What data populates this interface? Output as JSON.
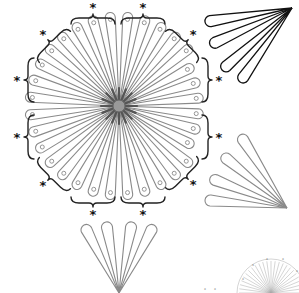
{
  "diagram": {
    "title": "",
    "center": {
      "x": 119,
      "y": 106,
      "disc_radius": 6
    },
    "petal_count": 32,
    "petal_length": 94,
    "petal_width": 7,
    "asterisk": "*",
    "brackets": [
      {
        "id": "top-left",
        "x": 93,
        "y": 10,
        "angle": 0
      },
      {
        "id": "top-right",
        "x": 143,
        "y": 10,
        "angle": 0
      },
      {
        "id": "upper-left",
        "x": 45,
        "y": 37,
        "angle": -45
      },
      {
        "id": "left-upper",
        "x": 20,
        "y": 80,
        "angle": -90
      },
      {
        "id": "left-lower",
        "x": 20,
        "y": 137,
        "angle": -90
      },
      {
        "id": "lower-left",
        "x": 45,
        "y": 183,
        "angle": -135
      },
      {
        "id": "bottom-left",
        "x": 93,
        "y": 211,
        "angle": 180
      },
      {
        "id": "bottom-right",
        "x": 143,
        "y": 211,
        "angle": 180
      },
      {
        "id": "upper-right",
        "x": 191,
        "y": 37,
        "angle": 45
      },
      {
        "id": "right-upper",
        "x": 216,
        "y": 80,
        "angle": 90
      },
      {
        "id": "right-lower",
        "x": 216,
        "y": 137,
        "angle": 90
      },
      {
        "id": "lower-right",
        "x": 191,
        "y": 182,
        "angle": 135
      }
    ],
    "fans": [
      {
        "id": "fan-upper-right",
        "style": "black",
        "apex": {
          "x": 292,
          "y": 8
        },
        "tips": [
          {
            "x": 205,
            "y": 22
          },
          {
            "x": 210,
            "y": 45
          },
          {
            "x": 222,
            "y": 70
          },
          {
            "x": 240,
            "y": 82
          }
        ]
      },
      {
        "id": "fan-right",
        "style": "gray",
        "apex": {
          "x": 287,
          "y": 208
        },
        "tips": [
          {
            "x": 240,
            "y": 135
          },
          {
            "x": 222,
            "y": 155
          },
          {
            "x": 210,
            "y": 178
          },
          {
            "x": 205,
            "y": 200
          }
        ]
      },
      {
        "id": "fan-bottom",
        "style": "gray",
        "apex": {
          "x": 119,
          "y": 293
        },
        "tips": [
          {
            "x": 84,
            "y": 225
          },
          {
            "x": 106,
            "y": 222
          },
          {
            "x": 132,
            "y": 222
          },
          {
            "x": 154,
            "y": 225
          }
        ]
      }
    ],
    "thumbnail": {
      "center": {
        "x": 271,
        "y": 293
      },
      "radius": 32,
      "label": "*"
    }
  }
}
